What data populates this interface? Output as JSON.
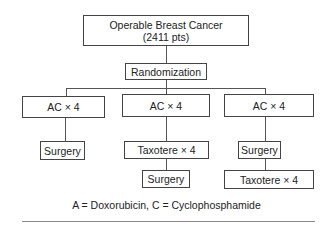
{
  "diagram": {
    "type": "flowchart",
    "root": {
      "line1": "Operable Breast Cancer",
      "line2": "(2411 pts)"
    },
    "randomization": "Randomization",
    "arms": [
      {
        "steps": [
          "AC × 4",
          "Surgery"
        ]
      },
      {
        "steps": [
          "AC × 4",
          "Taxotere × 4",
          "Surgery"
        ]
      },
      {
        "steps": [
          "AC × 4",
          "Surgery",
          "Taxotere × 4"
        ]
      }
    ],
    "caption": "A = Doxorubicin, C = Cyclophosphamide"
  }
}
